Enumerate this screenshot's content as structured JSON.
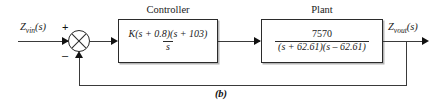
{
  "figure": {
    "caption": "(b)"
  },
  "signals": {
    "input": {
      "base": "Z",
      "sub": "vin",
      "arg": "(s)"
    },
    "output": {
      "base": "Z",
      "sub": "vout",
      "arg": "(s)"
    }
  },
  "summing_junction": {
    "name": "summing-junction",
    "plus_sign": "+",
    "minus_sign": "–"
  },
  "blocks": [
    {
      "id": "controller",
      "title": "Controller",
      "numerator": "K(s + 0.8)(s + 103)",
      "denominator": "s"
    },
    {
      "id": "plant",
      "title": "Plant",
      "numerator": "7570",
      "denominator": "(s + 62.61)(s – 62.61)"
    }
  ],
  "colors": {
    "line": "#3a3a3a",
    "block_border": "#2b2b2b",
    "text": "#1a1a1a",
    "background": "#ffffff"
  }
}
